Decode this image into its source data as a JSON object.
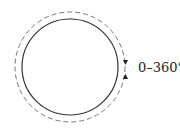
{
  "diagram": {
    "label": "0–360°",
    "inner_circle": {
      "style": "solid",
      "color": "#333333"
    },
    "outer_circle": {
      "style": "dashed",
      "color": "#777777"
    },
    "arrows": [
      "down-arrow",
      "up-arrow"
    ]
  }
}
